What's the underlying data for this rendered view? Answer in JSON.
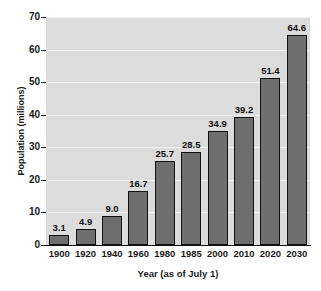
{
  "chart_data": {
    "type": "bar",
    "title": "",
    "xlabel": "Year (as of July 1)",
    "ylabel": "Population (millions)",
    "categories": [
      "1900",
      "1920",
      "1940",
      "1960",
      "1980",
      "1985",
      "2000",
      "2010",
      "2020",
      "2030"
    ],
    "values": [
      3.1,
      4.9,
      9.0,
      16.7,
      25.7,
      28.5,
      34.9,
      39.2,
      51.4,
      64.6
    ],
    "value_labels": [
      "3.1",
      "4.9",
      "9.0",
      "16.7",
      "25.7",
      "28.5",
      "34.9",
      "39.2",
      "51.4",
      "64.6"
    ],
    "ylim": [
      0,
      70
    ],
    "yticks": [
      0,
      10,
      20,
      30,
      40,
      50,
      60,
      70
    ],
    "ytick_labels": [
      "0",
      "10",
      "20",
      "30",
      "40",
      "50",
      "60",
      "70"
    ],
    "grid": true,
    "grid_axis": "y",
    "legend": false,
    "legend_position": "none",
    "colors": {
      "bar_fill": "#6e6e6e",
      "bar_edge": "#121212",
      "plot_background": "#dcdcdc",
      "gridline": "#f2f2f2",
      "axis": "#111111",
      "text": "#1a1a1a",
      "figure_background": "#ffffff"
    }
  }
}
